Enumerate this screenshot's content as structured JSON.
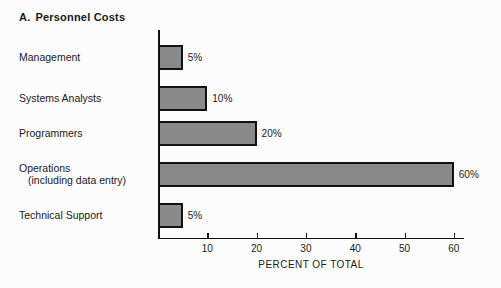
{
  "chart_data": {
    "type": "bar",
    "orientation": "horizontal",
    "title_letter": "A.",
    "title_text": "Personnel Costs",
    "categories": [
      "Management",
      "Systems Analysts",
      "Programmers",
      "Operations",
      "Technical Support"
    ],
    "category_sublabels": [
      "",
      "",
      "",
      "(including data entry)",
      ""
    ],
    "values": [
      5,
      10,
      20,
      60,
      5
    ],
    "value_labels": [
      "5%",
      "10%",
      "20%",
      "60%",
      "5%"
    ],
    "xlabel": "PERCENT OF TOTAL",
    "ylabel": "",
    "xlim": [
      0,
      62
    ],
    "xticks": [
      10,
      20,
      30,
      40,
      50,
      60
    ],
    "xtick_labels": [
      "10",
      "20",
      "30",
      "40",
      "50",
      "60"
    ],
    "grid": false,
    "legend": null,
    "bar_fill_color": "#8a8a8a",
    "bar_border_color": "#111111",
    "background_color": "#fcfcfc"
  }
}
